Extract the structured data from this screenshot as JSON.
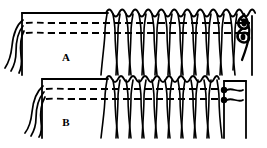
{
  "figure": {
    "background_color": "#ffffff",
    "ink_color": "#000000",
    "width": 267,
    "height": 148
  },
  "panels": [
    {
      "id": "A",
      "label": "A",
      "label_x": 66,
      "label_y": 61,
      "frame": {
        "x": 22,
        "y": 13,
        "width": 230,
        "height": 62
      },
      "scallop": {
        "start_x": 106,
        "end_x": 252,
        "y": 13,
        "count": 13,
        "amplitude": 5
      },
      "dashed_lines": [
        {
          "y": 23,
          "x_start": 26,
          "x_end": 250,
          "dash": "7 4"
        },
        {
          "y": 33,
          "x_start": 26,
          "x_end": 250,
          "dash": "7 4"
        }
      ],
      "knot_columns": [
        110,
        123,
        136,
        149,
        162,
        175,
        188,
        201,
        214,
        227,
        240
      ],
      "fringe_bottom_y": 75,
      "left_strands": 3,
      "terminator": {
        "type": "knot-loop",
        "x": 243,
        "y": 30,
        "description": "dark double looped knot at right end"
      }
    },
    {
      "id": "B",
      "label": "B",
      "label_x": 66,
      "label_y": 126,
      "frame": {
        "x": 42,
        "y": 79,
        "width": 206,
        "height": 59
      },
      "scallop": {
        "start_x": 106,
        "end_x": 225,
        "y": 79,
        "count": 11,
        "amplitude": 4
      },
      "dashed_lines": [
        {
          "y": 89,
          "x_start": 46,
          "x_end": 224,
          "dash": "7 4"
        },
        {
          "y": 99,
          "x_start": 46,
          "x_end": 224,
          "dash": "7 4"
        }
      ],
      "knot_columns": [
        110,
        123,
        136,
        149,
        162,
        175,
        188,
        201,
        214
      ],
      "fringe_bottom_y": 138,
      "left_strands": 3,
      "terminator": {
        "type": "beads",
        "beads": [
          {
            "cx": 224,
            "cy": 90,
            "r": 3.2
          },
          {
            "cx": 224,
            "cy": 100,
            "r": 3.2
          }
        ],
        "description": "two filled beads on the weft ends"
      }
    }
  ]
}
